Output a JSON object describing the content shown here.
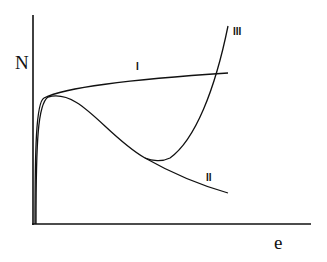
{
  "diagram": {
    "axes": {
      "y_label": "N",
      "x_label": "e"
    },
    "curves": [
      {
        "id": "I",
        "label": "I",
        "shape": "rises steeply then slowly increases"
      },
      {
        "id": "II",
        "label": "II",
        "shape": "peak near origin then decreasing"
      },
      {
        "id": "III",
        "label": "III",
        "shape": "follows II then sharply rises after minimum"
      }
    ],
    "stroke_color": "#111111",
    "background": "#ffffff"
  }
}
